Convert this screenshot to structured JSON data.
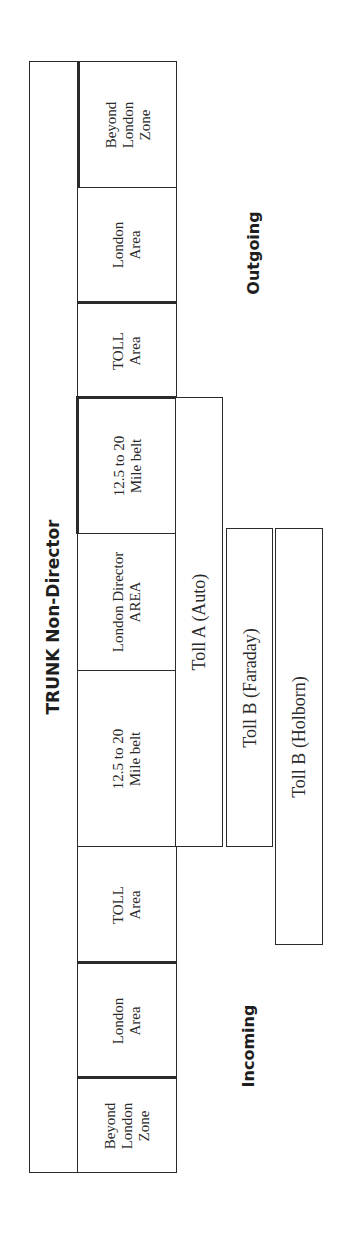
{
  "diagram": {
    "title": "TRUNK Non-Director",
    "orientation": "rotated -90deg (read bottom to top)",
    "side_labels": {
      "outgoing": "Outgoing",
      "incoming": "Incoming"
    },
    "zones": [
      {
        "id": "outgoing-beyond-london-zone",
        "lines": [
          "Beyond",
          "London",
          "Zone"
        ]
      },
      {
        "id": "outgoing-london-area",
        "lines": [
          "London",
          "Area"
        ]
      },
      {
        "id": "outgoing-toll-area",
        "lines": [
          "TOLL",
          "Area"
        ]
      },
      {
        "id": "outgoing-mile-belt",
        "lines": [
          "12.5  to 20",
          "Mile belt"
        ]
      },
      {
        "id": "london-director-area",
        "lines": [
          "London Director",
          "AREA"
        ]
      },
      {
        "id": "incoming-mile-belt",
        "lines": [
          "12.5  to 20",
          "Mile belt"
        ]
      },
      {
        "id": "incoming-toll-area",
        "lines": [
          "TOLL",
          "Area"
        ]
      },
      {
        "id": "incoming-london-area",
        "lines": [
          "London",
          "Area"
        ]
      },
      {
        "id": "incoming-beyond-london-zone",
        "lines": [
          "Beyond",
          "London",
          "Zone"
        ]
      }
    ],
    "exchanges": [
      {
        "id": "toll-a-auto",
        "label": "Toll  A (Auto)"
      },
      {
        "id": "toll-b-faraday",
        "label": "Toll  B (Faraday)"
      },
      {
        "id": "toll-b-holborn",
        "label": "Toll  B (Holborn)"
      }
    ]
  }
}
